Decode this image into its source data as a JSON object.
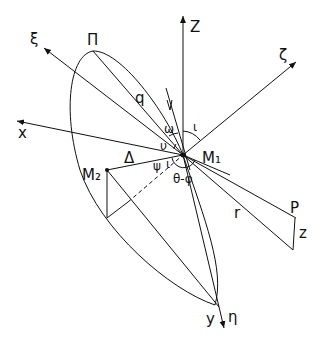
{
  "diagram": {
    "title": "",
    "origin_label": "M₁",
    "labels": {
      "Z": "Z",
      "zeta": "ζ",
      "xi": "ξ",
      "pi": "Π",
      "q": "q",
      "x": "x",
      "delta": "Δ",
      "M2": "M₂",
      "omega": "ω",
      "iota": "ι",
      "nu": "υ",
      "psi": "ψ",
      "i_small": "ι",
      "theta_phi": "θ-φ",
      "r": "r",
      "P": "P",
      "z": "z",
      "y": "y",
      "eta": "η"
    },
    "nodes": [
      {
        "id": "M1",
        "label": "M₁",
        "x": 183,
        "y": 155
      },
      {
        "id": "M2",
        "label": "M₂",
        "x": 107,
        "y": 170
      },
      {
        "id": "P",
        "label": "P",
        "x": 296,
        "y": 198
      },
      {
        "id": "Pi",
        "label": "Π",
        "x": 93,
        "y": 51
      }
    ],
    "axes": [
      {
        "name": "Z",
        "direction": "up"
      },
      {
        "name": "ζ",
        "direction": "upper-right"
      },
      {
        "name": "ξ",
        "direction": "upper-left"
      },
      {
        "name": "x",
        "direction": "left"
      },
      {
        "name": "y",
        "direction": "down"
      },
      {
        "name": "η",
        "direction": "down"
      }
    ]
  }
}
